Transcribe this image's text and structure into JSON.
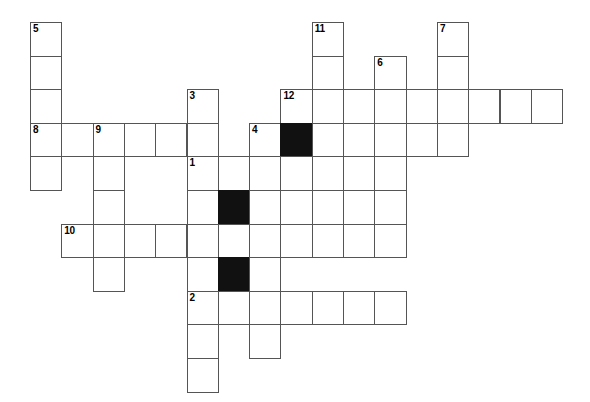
{
  "puzzle": {
    "type": "crossword-grid",
    "title": "",
    "grid_origin": {
      "x": 30,
      "y": 22
    },
    "cell_width": 31.3,
    "cell_height": 33.6,
    "colors": {
      "cell_fill": "#ffffff",
      "cell_border": "#555555",
      "block_fill": "#111111",
      "number_color": "#000000",
      "background": "#ffffff"
    },
    "clue_numbers": [
      {
        "label": "5",
        "col": 0,
        "row": 0
      },
      {
        "label": "11",
        "col": 9,
        "row": 0
      },
      {
        "label": "7",
        "col": 13,
        "row": 0
      },
      {
        "label": "6",
        "col": 11,
        "row": 1
      },
      {
        "label": "3",
        "col": 5,
        "row": 2
      },
      {
        "label": "12",
        "col": 8,
        "row": 2
      },
      {
        "label": "8",
        "col": 0,
        "row": 3
      },
      {
        "label": "9",
        "col": 2,
        "row": 3
      },
      {
        "label": "4",
        "col": 7,
        "row": 3
      },
      {
        "label": "1",
        "col": 5,
        "row": 4
      },
      {
        "label": "10",
        "col": 1,
        "row": 6
      },
      {
        "label": "2",
        "col": 5,
        "row": 8
      }
    ],
    "cells": [
      {
        "col": 0,
        "row": 0,
        "block": false
      },
      {
        "col": 0,
        "row": 1,
        "block": false
      },
      {
        "col": 0,
        "row": 2,
        "block": false
      },
      {
        "col": 0,
        "row": 3,
        "block": false
      },
      {
        "col": 0,
        "row": 4,
        "block": false
      },
      {
        "col": 9,
        "row": 0,
        "block": false
      },
      {
        "col": 9,
        "row": 1,
        "block": false
      },
      {
        "col": 13,
        "row": 0,
        "block": false
      },
      {
        "col": 13,
        "row": 1,
        "block": false
      },
      {
        "col": 11,
        "row": 1,
        "block": false
      },
      {
        "col": 5,
        "row": 2,
        "block": false
      },
      {
        "col": 8,
        "row": 2,
        "block": false
      },
      {
        "col": 9,
        "row": 2,
        "block": false
      },
      {
        "col": 10,
        "row": 2,
        "block": false
      },
      {
        "col": 11,
        "row": 2,
        "block": false
      },
      {
        "col": 12,
        "row": 2,
        "block": false
      },
      {
        "col": 13,
        "row": 2,
        "block": false
      },
      {
        "col": 14,
        "row": 2,
        "block": false
      },
      {
        "col": 15,
        "row": 2,
        "block": false
      },
      {
        "col": 16,
        "row": 2,
        "block": false
      },
      {
        "col": 1,
        "row": 3,
        "block": false
      },
      {
        "col": 2,
        "row": 3,
        "block": false
      },
      {
        "col": 3,
        "row": 3,
        "block": false
      },
      {
        "col": 4,
        "row": 3,
        "block": false
      },
      {
        "col": 5,
        "row": 3,
        "block": false
      },
      {
        "col": 7,
        "row": 3,
        "block": false
      },
      {
        "col": 8,
        "row": 3,
        "block": true
      },
      {
        "col": 9,
        "row": 3,
        "block": false
      },
      {
        "col": 10,
        "row": 3,
        "block": false
      },
      {
        "col": 11,
        "row": 3,
        "block": false
      },
      {
        "col": 12,
        "row": 3,
        "block": false
      },
      {
        "col": 13,
        "row": 3,
        "block": false
      },
      {
        "col": 2,
        "row": 4,
        "block": false
      },
      {
        "col": 5,
        "row": 4,
        "block": false
      },
      {
        "col": 6,
        "row": 4,
        "block": false
      },
      {
        "col": 7,
        "row": 4,
        "block": false
      },
      {
        "col": 8,
        "row": 4,
        "block": false
      },
      {
        "col": 9,
        "row": 4,
        "block": false
      },
      {
        "col": 10,
        "row": 4,
        "block": false
      },
      {
        "col": 11,
        "row": 4,
        "block": false
      },
      {
        "col": 2,
        "row": 5,
        "block": false
      },
      {
        "col": 5,
        "row": 5,
        "block": false
      },
      {
        "col": 6,
        "row": 5,
        "block": true
      },
      {
        "col": 7,
        "row": 5,
        "block": false
      },
      {
        "col": 8,
        "row": 5,
        "block": false
      },
      {
        "col": 9,
        "row": 5,
        "block": false
      },
      {
        "col": 10,
        "row": 5,
        "block": false
      },
      {
        "col": 11,
        "row": 5,
        "block": false
      },
      {
        "col": 1,
        "row": 6,
        "block": false
      },
      {
        "col": 2,
        "row": 6,
        "block": false
      },
      {
        "col": 3,
        "row": 6,
        "block": false
      },
      {
        "col": 4,
        "row": 6,
        "block": false
      },
      {
        "col": 5,
        "row": 6,
        "block": false
      },
      {
        "col": 6,
        "row": 6,
        "block": false
      },
      {
        "col": 7,
        "row": 6,
        "block": false
      },
      {
        "col": 8,
        "row": 6,
        "block": false
      },
      {
        "col": 9,
        "row": 6,
        "block": false
      },
      {
        "col": 10,
        "row": 6,
        "block": false
      },
      {
        "col": 11,
        "row": 6,
        "block": false
      },
      {
        "col": 2,
        "row": 7,
        "block": false
      },
      {
        "col": 5,
        "row": 7,
        "block": false
      },
      {
        "col": 6,
        "row": 7,
        "block": true
      },
      {
        "col": 7,
        "row": 7,
        "block": false
      },
      {
        "col": 5,
        "row": 8,
        "block": false
      },
      {
        "col": 6,
        "row": 8,
        "block": false
      },
      {
        "col": 7,
        "row": 8,
        "block": false
      },
      {
        "col": 8,
        "row": 8,
        "block": false
      },
      {
        "col": 9,
        "row": 8,
        "block": false
      },
      {
        "col": 10,
        "row": 8,
        "block": false
      },
      {
        "col": 11,
        "row": 8,
        "block": false
      },
      {
        "col": 5,
        "row": 9,
        "block": false
      },
      {
        "col": 7,
        "row": 9,
        "block": false
      },
      {
        "col": 5,
        "row": 10,
        "block": false
      }
    ]
  }
}
